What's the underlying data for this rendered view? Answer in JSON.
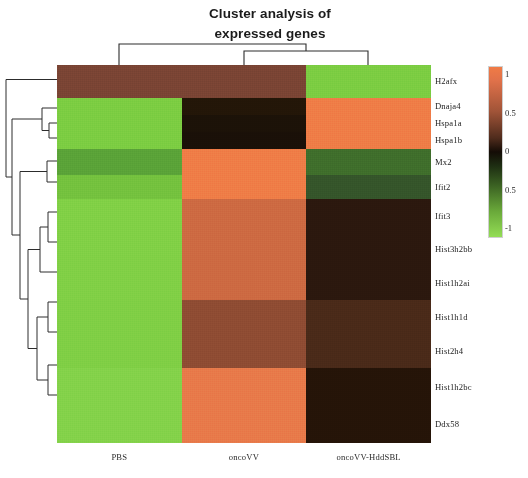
{
  "title": "Cluster analysis of\nexpressed genes",
  "title_line1": "Cluster analysis of",
  "title_line2": "expressed genes",
  "colorbar": {
    "ticks": [
      "1",
      "0.5",
      "0",
      "0.5",
      "-1"
    ],
    "tick_values": [
      1,
      0.5,
      0,
      -0.5,
      -1
    ],
    "low_color": "#93dd55",
    "mid_color": "#140c06",
    "high_color": "#f07b46"
  },
  "chart_data": {
    "type": "heatmap",
    "title": "Cluster analysis of expressed genes",
    "xlabel": "",
    "ylabel": "",
    "columns": [
      "PBS",
      "oncoVV",
      "oncoVV-HddSBL"
    ],
    "rows": [
      "H2afx",
      "Dnaja4",
      "Hspa1a",
      "Hspa1b",
      "Mx2",
      "Ifit2",
      "Ifit3",
      "Hist3h2bb",
      "Hist1h2ai",
      "Hist1h1d",
      "Hist2h4",
      "Hist1h2bc",
      "Ddx58"
    ],
    "zlim": [
      -1,
      1
    ],
    "colormap": "green-black-orange",
    "legend": "colorbar, right side",
    "grid": false,
    "values": [
      [
        0.35,
        0.32,
        -0.78
      ],
      [
        -0.85,
        -0.05,
        0.92
      ],
      [
        -0.85,
        -0.05,
        0.92
      ],
      [
        -0.85,
        -0.05,
        0.92
      ],
      [
        -0.55,
        0.88,
        -0.42
      ],
      [
        -0.72,
        0.88,
        -0.55
      ],
      [
        -0.88,
        0.52,
        0.1
      ],
      [
        -0.88,
        0.52,
        0.1
      ],
      [
        -0.88,
        0.52,
        0.1
      ],
      [
        -0.88,
        0.38,
        0.22
      ],
      [
        -0.88,
        0.38,
        0.22
      ],
      [
        -0.88,
        0.86,
        0.04
      ],
      [
        -0.88,
        0.86,
        0.04
      ]
    ],
    "cell_colors": [
      [
        "#7a4434",
        "#7a4434",
        "#7ccd42"
      ],
      [
        "#7ccd42",
        "#231608",
        "#ef7d47"
      ],
      [
        "#7ccd42",
        "#1c1208",
        "#ef7d47"
      ],
      [
        "#7ccd42",
        "#1a1008",
        "#ef7d47"
      ],
      [
        "#5aa338",
        "#ef7d47",
        "#3f6e2b"
      ],
      [
        "#74c23e",
        "#ef7d47",
        "#35552a"
      ],
      [
        "#81d046",
        "#cd6a42",
        "#2b180e"
      ],
      [
        "#81d046",
        "#cd6a42",
        "#2b180e"
      ],
      [
        "#81d046",
        "#cd6a42",
        "#2b180e"
      ],
      [
        "#80cf45",
        "#8f4c33",
        "#4a2a19"
      ],
      [
        "#80cf45",
        "#8f4c33",
        "#4a2a19"
      ],
      [
        "#84d24a",
        "#e87a4a",
        "#251408"
      ],
      [
        "#84d24a",
        "#e87a4a",
        "#251408"
      ]
    ],
    "row_dendrogram": "present, left side",
    "col_dendrogram": "present, top; oncoVV and oncoVV-HddSBL merge first, then PBS"
  }
}
